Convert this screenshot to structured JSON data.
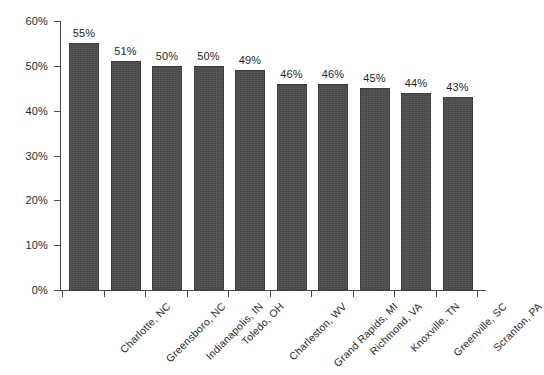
{
  "chart_data": {
    "type": "bar",
    "title": "",
    "subtitle": "",
    "xlabel": "",
    "ylabel": "",
    "categories": [
      "Charlotte, NC",
      "Greensboro, NC",
      "Indianapolis, IN",
      "Toledo, OH",
      "Charleston, WV",
      "Grand Rapids, MI",
      "Richmond, VA",
      "Knoxville, TN",
      "Greenville, SC",
      "Scranton, PA"
    ],
    "values": [
      55,
      51,
      50,
      50,
      49,
      46,
      46,
      45,
      44,
      43
    ],
    "value_labels": [
      "55%",
      "51%",
      "50%",
      "50%",
      "49%",
      "46%",
      "46%",
      "45%",
      "44%",
      "43%"
    ],
    "ylim": [
      0,
      60
    ],
    "ytick_values": [
      0,
      10,
      20,
      30,
      40,
      50,
      60
    ],
    "ytick_labels": [
      "0%",
      "10%",
      "20%",
      "30%",
      "40%",
      "50%",
      "60%"
    ],
    "grid": false,
    "legend": null,
    "legend_position": "none",
    "bar_color": "#4d4d4d",
    "axis_color": "#4a4a4a",
    "text_color": "#2b2b2b",
    "background_color": "#ffffff",
    "xtick_label_rotation": -45,
    "series": [
      {
        "name": "",
        "values": [
          55,
          51,
          50,
          50,
          49,
          46,
          46,
          45,
          44,
          43
        ]
      }
    ]
  }
}
